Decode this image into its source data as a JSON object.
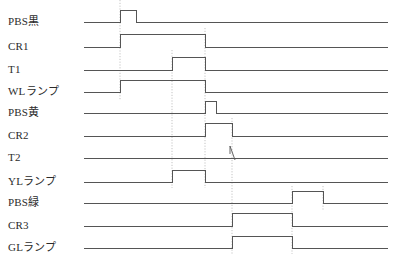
{
  "diagram": {
    "type": "timing-diagram",
    "title": "",
    "axis": {
      "x_start": 84,
      "x_end": 388,
      "row_count": 11
    },
    "signals": [
      {
        "name": "PBS黒",
        "latin": "PBS",
        "jp": "黒",
        "row": 0,
        "baseline_y": 22,
        "high_y": 10,
        "transitions": [
          {
            "x": 120,
            "edge": "rise"
          },
          {
            "x": 136,
            "edge": "fall"
          }
        ],
        "shape": "pulse"
      },
      {
        "name": "CR1",
        "latin": "CR1",
        "jp": "",
        "row": 1,
        "baseline_y": 47,
        "high_y": 34,
        "transitions": [
          {
            "x": 120,
            "edge": "rise"
          },
          {
            "x": 205,
            "edge": "fall"
          }
        ],
        "shape": "pulse"
      },
      {
        "name": "T1",
        "latin": "T1",
        "jp": "",
        "row": 2,
        "baseline_y": 70,
        "high_y": 57,
        "transitions": [
          {
            "x": 172,
            "edge": "rise"
          },
          {
            "x": 205,
            "edge": "fall"
          }
        ],
        "shape": "pulse"
      },
      {
        "name": "WLランプ",
        "latin": "WL",
        "jp": "ランプ",
        "row": 3,
        "baseline_y": 92,
        "high_y": 80,
        "transitions": [
          {
            "x": 120,
            "edge": "rise"
          },
          {
            "x": 205,
            "edge": "fall"
          }
        ],
        "shape": "pulse"
      },
      {
        "name": "PBS黄",
        "latin": "PBS",
        "jp": "黄",
        "row": 4,
        "baseline_y": 113,
        "high_y": 101,
        "transitions": [
          {
            "x": 205,
            "edge": "rise"
          },
          {
            "x": 216,
            "edge": "fall"
          }
        ],
        "shape": "pulse"
      },
      {
        "name": "CR2",
        "latin": "CR2",
        "jp": "",
        "row": 5,
        "baseline_y": 136,
        "high_y": 123,
        "transitions": [
          {
            "x": 205,
            "edge": "rise"
          },
          {
            "x": 232,
            "edge": "fall"
          }
        ],
        "shape": "pulse"
      },
      {
        "name": "T2",
        "latin": "T2",
        "jp": "",
        "row": 6,
        "baseline_y": 158,
        "high_y": 146,
        "transitions": [],
        "shape": "flat-with-mark",
        "mark_x": 232
      },
      {
        "name": "YLランプ",
        "latin": "YL",
        "jp": "ランプ",
        "row": 7,
        "baseline_y": 182,
        "high_y": 170,
        "transitions": [
          {
            "x": 172,
            "edge": "rise"
          },
          {
            "x": 205,
            "edge": "fall"
          }
        ],
        "shape": "pulse"
      },
      {
        "name": "PBS緑",
        "latin": "PBS",
        "jp": "緑",
        "row": 8,
        "baseline_y": 203,
        "high_y": 191,
        "transitions": [
          {
            "x": 292,
            "edge": "rise"
          },
          {
            "x": 323,
            "edge": "fall"
          }
        ],
        "shape": "pulse"
      },
      {
        "name": "CR3",
        "latin": "CR3",
        "jp": "",
        "row": 9,
        "baseline_y": 226,
        "high_y": 213,
        "transitions": [
          {
            "x": 232,
            "edge": "rise"
          },
          {
            "x": 292,
            "edge": "fall"
          }
        ],
        "shape": "pulse"
      },
      {
        "name": "GLランプ",
        "latin": "GL",
        "jp": "ランプ",
        "row": 10,
        "baseline_y": 248,
        "high_y": 236,
        "transitions": [
          {
            "x": 232,
            "edge": "rise"
          },
          {
            "x": 292,
            "edge": "fall"
          }
        ],
        "shape": "pulse"
      }
    ],
    "guides": [
      {
        "x": 120,
        "y_top": 0,
        "y_bottom": 100
      },
      {
        "x": 172,
        "y_top": 50,
        "y_bottom": 188
      },
      {
        "x": 205,
        "y_top": 28,
        "y_bottom": 188
      },
      {
        "x": 232,
        "y_top": 118,
        "y_bottom": 254
      },
      {
        "x": 292,
        "y_top": 186,
        "y_bottom": 254
      },
      {
        "x": 323,
        "y_top": 186,
        "y_bottom": 210
      }
    ],
    "colors": {
      "wave_stroke": "#555555",
      "guide_stroke": "#aaaaaa",
      "text": "#2b2b2b",
      "background": "#ffffff"
    }
  }
}
